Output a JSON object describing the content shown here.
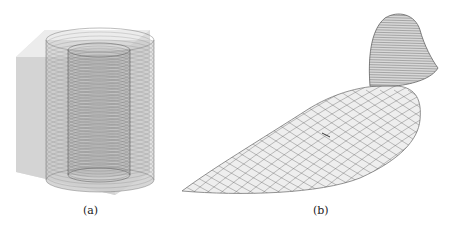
{
  "figure": {
    "panels": [
      {
        "id": "a",
        "caption": "(a)",
        "subject": "transparent cube containing two concentric wireframe cylinders"
      },
      {
        "id": "b",
        "caption": "(b)",
        "subject": "wireframe bird-shaped surface mesh"
      }
    ],
    "colors": {
      "cube_fill": "#d9d9d9",
      "wire": "#555555",
      "background": "#ffffff"
    }
  }
}
